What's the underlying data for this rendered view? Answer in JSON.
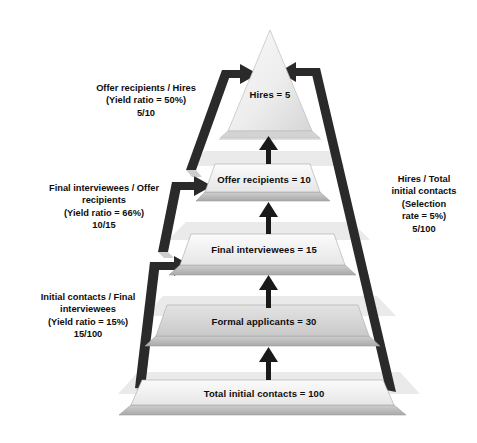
{
  "diagram": {
    "type": "funnel-pyramid",
    "colors": {
      "slab_top": "#f2f2f2",
      "slab_front": "#b8b8b8",
      "slab_edge": "#9a9a9a",
      "bracket": "#1f1f1f",
      "arrow": "#1a1a1a",
      "text": "#0d0d0d",
      "background": "#ffffff"
    }
  },
  "tiers": [
    {
      "id": "hires",
      "label": "Hires = 5",
      "stage": "Hires",
      "value": 5,
      "shape": "triangle-apex"
    },
    {
      "id": "offer-recipients",
      "label": "Offer recipients = 10",
      "stage": "Offer recipients",
      "value": 10,
      "shape": "slab"
    },
    {
      "id": "final-interviewees",
      "label": "Final interviewees = 15",
      "stage": "Final interviewees",
      "value": 15,
      "shape": "slab"
    },
    {
      "id": "formal-applicants",
      "label": "Formal applicants = 30",
      "stage": "Formal applicants",
      "value": 30,
      "shape": "slab"
    },
    {
      "id": "total-initial-contacts",
      "label": "Total initial contacts = 100",
      "stage": "Total initial contacts",
      "value": 100,
      "shape": "slab"
    }
  ],
  "ratios": [
    {
      "id": "offer-to-hires",
      "side": "left",
      "line1": "Offer recipients / Hires",
      "line2": "(Yield ratio = 50%)",
      "line3": "5/10",
      "ratio_percent": 50,
      "fraction": "5/10"
    },
    {
      "id": "final-to-offer",
      "side": "left",
      "line1": "Final interviewees / Offer",
      "line2": "recipients",
      "line3": "(Yield ratio = 66%)",
      "line4": "10/15",
      "ratio_percent": 66,
      "fraction": "10/15"
    },
    {
      "id": "initial-to-final",
      "side": "left",
      "line1": "Initial contacts / Final",
      "line2": "interviewees",
      "line3": "(Yield ratio = 15%)",
      "line4": "15/100",
      "ratio_percent": 15,
      "fraction": "15/100"
    },
    {
      "id": "selection-rate",
      "side": "right",
      "line1": "Hires / Total",
      "line2": "initial contacts",
      "line3": "(Selection",
      "line4": "rate = 5%)",
      "line5": "5/100",
      "ratio_percent": 5,
      "fraction": "5/100"
    }
  ]
}
